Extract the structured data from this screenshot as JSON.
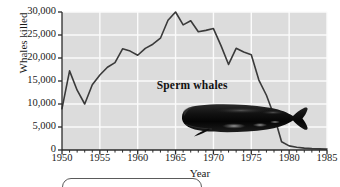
{
  "chart_data": {
    "type": "line",
    "title": "",
    "xlabel": "Year",
    "ylabel": "Whales killed",
    "xlim": [
      1950,
      1985
    ],
    "ylim": [
      0,
      30000
    ],
    "grid": true,
    "legend_position": "none",
    "annotations": [
      {
        "text": "Sperm whales",
        "x": 1967.2,
        "y": 13900
      }
    ],
    "xticks": [
      1950,
      1955,
      1960,
      1965,
      1970,
      1975,
      1980,
      1985
    ],
    "xtick_labels": [
      "1950",
      "1955",
      "1960",
      "1965",
      "1970",
      "1975",
      "1980",
      "1985"
    ],
    "xminor_step": 1,
    "yticks": [
      0,
      5000,
      10000,
      15000,
      20000,
      25000,
      30000
    ],
    "ytick_labels": [
      "0",
      "5,000",
      "10,000",
      "15,000",
      "20,000",
      "25,000",
      "30,000"
    ],
    "series": [
      {
        "name": "Sperm whales",
        "x": [
          1950,
          1951,
          1952,
          1953,
          1954,
          1955,
          1956,
          1957,
          1958,
          1959,
          1960,
          1961,
          1962,
          1963,
          1964,
          1965,
          1966,
          1967,
          1968,
          1969,
          1970,
          1971,
          1972,
          1973,
          1974,
          1975,
          1976,
          1977,
          1978,
          1979,
          1980,
          1981,
          1982,
          1983,
          1984,
          1985
        ],
        "values": [
          9000,
          17200,
          13000,
          10000,
          14200,
          16300,
          18000,
          19000,
          22000,
          21500,
          20600,
          22100,
          23000,
          24300,
          28200,
          30000,
          27200,
          28100,
          25700,
          26000,
          26400,
          22700,
          18600,
          22100,
          21300,
          20700,
          15200,
          11900,
          7500,
          1800,
          900,
          600,
          400,
          300,
          250,
          200
        ]
      }
    ]
  },
  "figure": {
    "axis_color": "#2b2b2b",
    "line_color": "#3a3a3a",
    "plot_background": "#dcdcdc",
    "grid_color": "#fbfbfb",
    "whale_color": "#151515"
  },
  "whale_image": {
    "name": "sperm-whale-photo",
    "alt": "Sperm whale"
  }
}
